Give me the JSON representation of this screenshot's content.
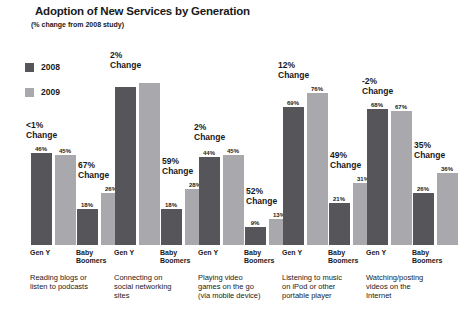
{
  "chart_data": {
    "type": "bar",
    "title": "Adoption of New Services by Generation",
    "subtitle": "(% change from 2008 study)",
    "xlabel": "",
    "ylabel": "",
    "ylim": [
      0,
      100
    ],
    "grid": false,
    "legend_position": "top-left",
    "legend": [
      {
        "name": "2008",
        "color": "#55555a"
      },
      {
        "name": "2009",
        "color": "#a9a9ad"
      }
    ],
    "series": [
      {
        "name": "2008",
        "color": "#55555a"
      },
      {
        "name": "2009",
        "color": "#a9a9ad"
      }
    ],
    "categories": [
      "Reading blogs or listen to podcasts",
      "Connecting on social networking sites",
      "Playing video games on the go (via mobile device)",
      "Listening to music on iPod or other portable player",
      "Watching/posting videos on the Internet"
    ],
    "subgroups": [
      "Gen Y",
      "Baby Boomers"
    ],
    "groups": [
      {
        "category": "Reading blogs or listen to podcasts",
        "bars": [
          {
            "subgroup": "Gen Y",
            "change": "<1%",
            "change_line1": "<1%",
            "change_line2": "Change",
            "values": [
              46,
              45
            ],
            "labels": [
              "46%",
              "45%"
            ]
          },
          {
            "subgroup": "Baby Boomers",
            "change": "67%",
            "change_line1": "67%",
            "change_line2": "Change",
            "values": [
              18,
              26
            ],
            "labels": [
              "18%",
              "26%"
            ]
          }
        ]
      },
      {
        "category": "Connecting on social networking sites",
        "bars": [
          {
            "subgroup": "Gen Y",
            "change": "2%",
            "change_line1": "2%",
            "change_line2": "Change",
            "values": [
              79,
              81
            ],
            "labels": [
              "",
              ""
            ]
          },
          {
            "subgroup": "Baby Boomers",
            "change": "59%",
            "change_line1": "59%",
            "change_line2": "Change",
            "values": [
              18,
              28
            ],
            "labels": [
              "18%",
              "28%"
            ]
          }
        ]
      },
      {
        "category": "Playing video games on the go (via mobile device)",
        "bars": [
          {
            "subgroup": "Gen Y",
            "change": "2%",
            "change_line1": "2%",
            "change_line2": "Change",
            "values": [
              44,
              45
            ],
            "labels": [
              "44%",
              "45%"
            ]
          },
          {
            "subgroup": "Baby Boomers",
            "change": "52%",
            "change_line1": "52%",
            "change_line2": "Change",
            "values": [
              9,
              13
            ],
            "labels": [
              "9%",
              "13%"
            ]
          }
        ]
      },
      {
        "category": "Listening to music on iPod or other portable player",
        "bars": [
          {
            "subgroup": "Gen Y",
            "change": "12%",
            "change_line1": "12%",
            "change_line2": "Change",
            "values": [
              69,
              76
            ],
            "labels": [
              "69%",
              "76%"
            ]
          },
          {
            "subgroup": "Baby Boomers",
            "change": "49%",
            "change_line1": "49%",
            "change_line2": "Change",
            "values": [
              21,
              31
            ],
            "labels": [
              "21%",
              "31%"
            ]
          }
        ]
      },
      {
        "category": "Watching/posting videos on the Internet",
        "bars": [
          {
            "subgroup": "Gen Y",
            "change": "-2%",
            "change_line1": "-2%",
            "change_line2": "Change",
            "values": [
              68,
              67
            ],
            "labels": [
              "68%",
              "67%"
            ]
          },
          {
            "subgroup": "Baby Boomers",
            "change": "35%",
            "change_line1": "35%",
            "change_line2": "Change",
            "values": [
              26,
              36
            ],
            "labels": [
              "26%",
              "36%"
            ]
          }
        ]
      }
    ],
    "category_desc_lines": [
      [
        "Reading blogs or",
        "listen to podcasts"
      ],
      [
        "Connecting on",
        "social networking",
        "sites"
      ],
      [
        "Playing video",
        "games on the go",
        "(via mobile device)"
      ],
      [
        "Listening to music",
        "on iPod or other",
        "portable player"
      ],
      [
        "Watching/posting",
        "videos on the",
        "Internet"
      ]
    ]
  }
}
